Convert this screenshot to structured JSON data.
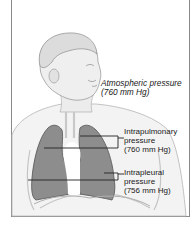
{
  "figure": {
    "type": "anatomical-illustration",
    "labels": {
      "atmospheric": {
        "line1": "Atmospheric pressure",
        "line2": "(760 mm Hg)"
      },
      "intrapulmonary": {
        "line1": "Intrapulmonary",
        "line2": "pressure",
        "line3": "(760 mm Hg)"
      },
      "intrapleural": {
        "line1": "Intrapleural",
        "line2": "pressure",
        "line3": "(756 mm Hg)"
      }
    },
    "colors": {
      "lung_fill": "#8d8d8d",
      "lung_edge": "#5e5e5e",
      "skin_shade": "#d9d9d9",
      "line": "#222222"
    }
  }
}
